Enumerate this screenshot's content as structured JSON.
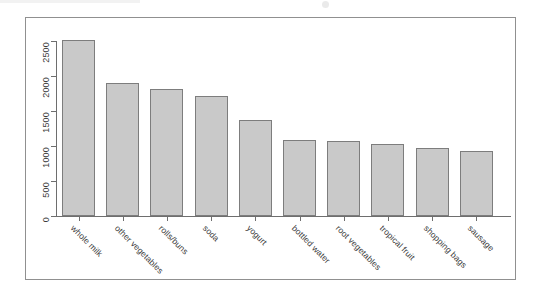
{
  "chart_data": {
    "type": "bar",
    "title": "",
    "subtitle": "",
    "xlabel": "",
    "ylabel": "item frequency (absolute)",
    "categories": [
      "whole milk",
      "other vegetables",
      "rolls/buns",
      "soda",
      "yogurt",
      "bottled water",
      "root vegetables",
      "tropical fruit",
      "shopping bags",
      "sausage"
    ],
    "values": [
      2513,
      1903,
      1809,
      1715,
      1372,
      1087,
      1072,
      1032,
      969,
      924
    ],
    "ylim": [
      0,
      2513
    ],
    "y_ticks": [
      0,
      500,
      1000,
      1500,
      2000,
      2500
    ],
    "y_tick_labels": [
      "0",
      "500",
      "1000",
      "1500",
      "2000",
      "2500"
    ],
    "grid": false,
    "legend": null,
    "legend_position": "none",
    "bar_fill_color": "#c9c9c9",
    "bar_border_color": "#7d7d7d",
    "axis_color": "#6e6e6e",
    "text_color": "#3a3a3a",
    "background_color": "#ffffff",
    "x_tick_label_rotation": 45,
    "y_tick_label_rotation": -90,
    "frame": true
  }
}
